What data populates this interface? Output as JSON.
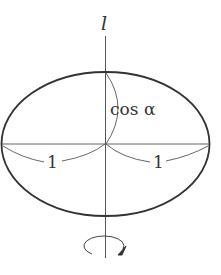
{
  "diagram": {
    "axis_label": "l",
    "vertical_label": "cos α",
    "radius_left_label": "1",
    "radius_right_label": "1",
    "rotation_symbol": "rotation-arrow",
    "colors": {
      "ellipse": "#333333",
      "lines": "#555555",
      "text": "#333333"
    }
  }
}
